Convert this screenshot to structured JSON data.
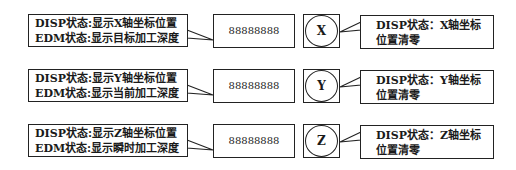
{
  "rows": [
    {
      "axis": "X",
      "left_callout": [
        "DISP状态:显示X轴坐标位置",
        "EDM状态:显示目标加工深度"
      ],
      "display_value": "88888888",
      "key_label": "X",
      "right_callout": [
        "DISP状态：X轴坐标",
        "位置清零"
      ]
    },
    {
      "axis": "Y",
      "left_callout": [
        "DISP状态:显示Y轴坐标位置",
        "EDM状态:显示当前加工深度"
      ],
      "display_value": "88888888",
      "key_label": "Y",
      "right_callout": [
        "DISP状态：Y轴坐标",
        "位置清零"
      ]
    },
    {
      "axis": "Z",
      "left_callout": [
        "DISP状态:显示Z轴坐标位置",
        "EDM状态:显示瞬时加工深度"
      ],
      "display_value": "88888888",
      "key_label": "Z",
      "right_callout": [
        "DISP状态：Z轴坐标",
        "位置清零"
      ]
    }
  ]
}
